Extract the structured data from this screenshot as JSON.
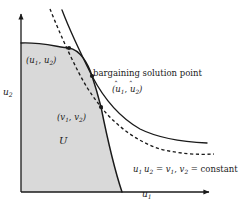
{
  "figure": {
    "background_color": "#ffffff",
    "line_color": "#1a1a1a",
    "region_fill_color": "#d9d9d9"
  },
  "axes": {
    "x_label": "u",
    "x_label_sub": "1",
    "y_label": "u",
    "y_label_sub": "2",
    "x_axis_arrow": "arrow-right",
    "y_axis_arrow": "arrow-up",
    "origin_px": [
      21,
      192
    ],
    "x_axis_end_px": [
      215,
      192
    ],
    "y_axis_end_px": [
      21,
      10
    ]
  },
  "region": {
    "name": "U",
    "label": "U",
    "description": "feasible utility set, shaded"
  },
  "points": [
    {
      "name": "pareto-point-u",
      "label_open": "(",
      "var1": "u",
      "sub1": "1",
      "sep": ", ",
      "var2": "u",
      "sub2": "2",
      "label_close": ")",
      "hat": false,
      "marker_px": [
        69,
        48
      ]
    },
    {
      "name": "bargaining-solution-point",
      "label_open": "(",
      "var1": "u",
      "sub1": "1",
      "sep": ", ",
      "var2": "u",
      "sub2": "2",
      "label_close": ")",
      "hat": true,
      "marker_px": [
        92,
        76
      ]
    },
    {
      "name": "status-quo-point-v",
      "label_open": "(",
      "var1": "v",
      "sub1": "1",
      "sep": ", ",
      "var2": "v",
      "sub2": "2",
      "label_close": ")",
      "hat": false,
      "marker_px": [
        101,
        107
      ]
    }
  ],
  "annotations": {
    "solution_title": "bargaining solution point",
    "equation": {
      "lhs_var1": "u",
      "lhs_sub1": "1",
      "lhs_var2": "u",
      "lhs_sub2": "2",
      "eq1": "=",
      "rhs_var1": "v",
      "rhs_sub1": "1",
      "comma": ",",
      "rhs_var2": "v",
      "rhs_sub2": "2",
      "eq2": "=",
      "constant": "constant"
    }
  },
  "curves": [
    {
      "name": "pareto-frontier",
      "style": "solid",
      "description": "upper boundary of feasible set U"
    },
    {
      "name": "hyperbola-solid",
      "style": "solid",
      "description": "u1*u2 = constant through bargaining solution point, tangent to frontier"
    },
    {
      "name": "hyperbola-dashed",
      "style": "dashed",
      "description": "u1*u2 = v1*v2 = constant through status quo point"
    }
  ]
}
